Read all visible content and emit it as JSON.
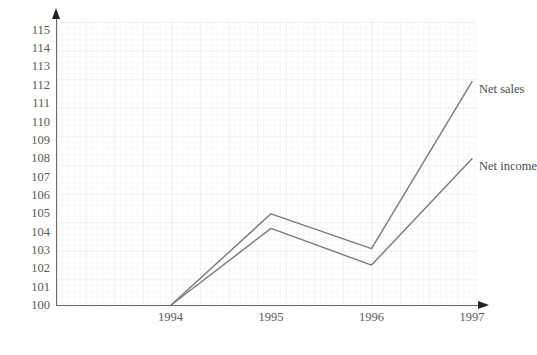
{
  "chart_data": {
    "type": "line",
    "title": "",
    "xlabel": "",
    "ylabel": "",
    "categories": [
      "1994",
      "1995",
      "1996",
      "1997"
    ],
    "ylim": [
      100,
      115
    ],
    "xlim": [
      "1994",
      "1997"
    ],
    "yticks": [
      "115",
      "114",
      "113",
      "112",
      "111",
      "110",
      "109",
      "108",
      "107",
      "106",
      "105",
      "104",
      "103",
      "102",
      "101",
      "100"
    ],
    "grid": true,
    "legend_position": "inline-right-end-of-line",
    "series": [
      {
        "name": "Net sales",
        "values": [
          100,
          105,
          103.1,
          112.2
        ],
        "color": "#7a7a7a"
      },
      {
        "name": "Net income",
        "values": [
          100,
          104.2,
          102.2,
          108
        ],
        "color": "#7a7a7a"
      }
    ]
  },
  "axis": {
    "y_arrow_icon": "arrow-up-icon",
    "x_arrow_icon": "arrow-right-icon"
  },
  "colors": {
    "line": "#7a7a7a",
    "axis": "#6b6b6b",
    "grid_major": "#eef0f4",
    "grid_minor": "#f6f7fa",
    "text": "#5a5a5a"
  }
}
